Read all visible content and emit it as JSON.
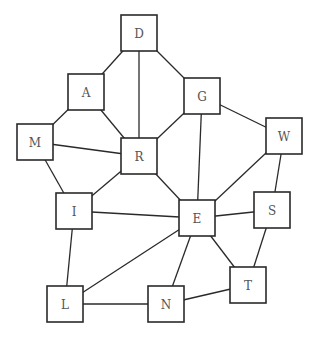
{
  "diagram": {
    "type": "undirected-graph",
    "node_size": 36,
    "colors": {
      "stroke": "#2a2a2a",
      "fill": "#ffffff",
      "label": "#555555"
    },
    "nodes": [
      {
        "id": "D",
        "label": "D",
        "x": 121,
        "y": 15
      },
      {
        "id": "A",
        "label": "A",
        "x": 68,
        "y": 74
      },
      {
        "id": "M",
        "label": "M",
        "x": 17,
        "y": 124
      },
      {
        "id": "R",
        "label": "R",
        "x": 121,
        "y": 138
      },
      {
        "id": "G",
        "label": "G",
        "x": 184,
        "y": 78
      },
      {
        "id": "W",
        "label": "W",
        "x": 266,
        "y": 118
      },
      {
        "id": "I",
        "label": "I",
        "x": 56,
        "y": 193
      },
      {
        "id": "E",
        "label": "E",
        "x": 179,
        "y": 200
      },
      {
        "id": "S",
        "label": "S",
        "x": 254,
        "y": 192
      },
      {
        "id": "L",
        "label": "L",
        "x": 47,
        "y": 286
      },
      {
        "id": "N",
        "label": "N",
        "x": 148,
        "y": 286
      },
      {
        "id": "T",
        "label": "T",
        "x": 230,
        "y": 267
      }
    ],
    "edges": [
      [
        "D",
        "A"
      ],
      [
        "D",
        "R"
      ],
      [
        "D",
        "G"
      ],
      [
        "A",
        "M"
      ],
      [
        "A",
        "R"
      ],
      [
        "M",
        "R"
      ],
      [
        "M",
        "I"
      ],
      [
        "R",
        "I"
      ],
      [
        "R",
        "E"
      ],
      [
        "R",
        "G"
      ],
      [
        "G",
        "E"
      ],
      [
        "G",
        "W"
      ],
      [
        "W",
        "E"
      ],
      [
        "W",
        "S"
      ],
      [
        "I",
        "E"
      ],
      [
        "I",
        "L"
      ],
      [
        "E",
        "S"
      ],
      [
        "E",
        "L"
      ],
      [
        "E",
        "N"
      ],
      [
        "E",
        "T"
      ],
      [
        "S",
        "T"
      ],
      [
        "L",
        "N"
      ],
      [
        "N",
        "T"
      ]
    ]
  }
}
